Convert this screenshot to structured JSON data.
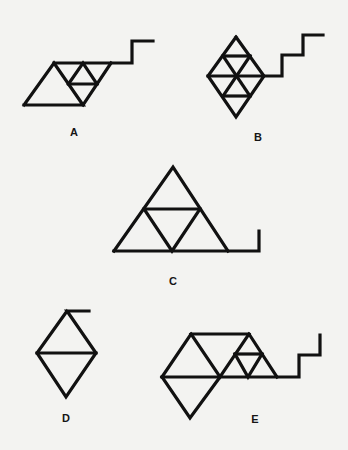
{
  "background": "#f3f3f1",
  "stroke_color": "#111111",
  "options": [
    {
      "label": "A",
      "label_pos": [
        74,
        132
      ],
      "description": "Parallelogram with triangular subdivisions and a stepped line extending from top-right",
      "polylines": [
        [
          [
            24,
            105
          ],
          [
            54,
            63
          ],
          [
            83,
            105
          ],
          [
            24,
            105
          ]
        ],
        [
          [
            54,
            63
          ],
          [
            132,
            63
          ],
          [
            132,
            41
          ],
          [
            153,
            41
          ]
        ],
        [
          [
            111,
            63
          ],
          [
            83,
            105
          ]
        ],
        [
          [
            68.5,
            84
          ],
          [
            83,
            63
          ],
          [
            97,
            84
          ]
        ],
        [
          [
            68.5,
            84
          ],
          [
            97,
            84
          ]
        ]
      ]
    },
    {
      "label": "B",
      "label_pos": [
        258,
        137
      ],
      "description": "Diamond subdivided into eight small triangles with a two-step staircase line to the right",
      "polylines": [
        [
          [
            236,
            37
          ],
          [
            264,
            76
          ],
          [
            236,
            117
          ],
          [
            208,
            76
          ],
          [
            236,
            37
          ]
        ],
        [
          [
            223,
            56
          ],
          [
            250,
            56
          ]
        ],
        [
          [
            208,
            76
          ],
          [
            282,
            76
          ],
          [
            282,
            55
          ],
          [
            303,
            55
          ],
          [
            303,
            35
          ],
          [
            323,
            35
          ]
        ],
        [
          [
            223,
            96
          ],
          [
            250,
            96
          ]
        ],
        [
          [
            223,
            56
          ],
          [
            250,
            96
          ]
        ],
        [
          [
            250,
            56
          ],
          [
            223,
            96
          ]
        ]
      ]
    },
    {
      "label": "C",
      "label_pos": [
        173,
        281
      ],
      "description": "Large triangle divided into four triangles with a hook line at the right end of the base",
      "polylines": [
        [
          [
            114,
            251
          ],
          [
            173,
            167
          ],
          [
            228,
            251
          ]
        ],
        [
          [
            114,
            251
          ],
          [
            259,
            251
          ],
          [
            259,
            231
          ]
        ],
        [
          [
            144,
            209
          ],
          [
            200,
            209
          ]
        ],
        [
          [
            144,
            209
          ],
          [
            172,
            251
          ],
          [
            200,
            209
          ]
        ]
      ]
    },
    {
      "label": "D",
      "label_pos": [
        66,
        418
      ],
      "description": "Diamond split by a horizontal line with a short tail at the top",
      "polylines": [
        [
          [
            89,
            311
          ],
          [
            67,
            311
          ],
          [
            96,
            353
          ],
          [
            66,
            397
          ],
          [
            37,
            353
          ],
          [
            67,
            311
          ]
        ],
        [
          [
            37,
            353
          ],
          [
            96,
            353
          ]
        ]
      ]
    },
    {
      "label": "E",
      "label_pos": [
        255,
        419
      ],
      "description": "Composite of trapezoid, downward triangle and subdivided triangle with staircase line",
      "polylines": [
        [
          [
            162,
            377
          ],
          [
            191,
            334
          ],
          [
            249,
            334
          ],
          [
            277,
            377
          ]
        ],
        [
          [
            191,
            334
          ],
          [
            220,
            377
          ],
          [
            249,
            334
          ]
        ],
        [
          [
            162,
            377
          ],
          [
            190,
            418
          ],
          [
            220,
            377
          ]
        ],
        [
          [
            162,
            377
          ],
          [
            299,
            377
          ],
          [
            299,
            355
          ],
          [
            320,
            355
          ],
          [
            320,
            335
          ]
        ],
        [
          [
            235,
            354
          ],
          [
            262,
            354
          ]
        ],
        [
          [
            235,
            354
          ],
          [
            248,
            377
          ],
          [
            262,
            354
          ]
        ]
      ]
    }
  ]
}
